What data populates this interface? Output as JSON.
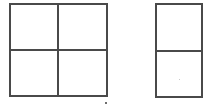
{
  "canvas": {
    "width": 220,
    "height": 110,
    "background_color": "#ffffff"
  },
  "style": {
    "line_color": "#4a4a4a",
    "line_width_px": 2,
    "fill_color": "#ffffff",
    "artifact_color": "#6e6e6e"
  },
  "figures": [
    {
      "id": "figure-quad",
      "name": "two-by-two-grid",
      "description": "Square divided into four equal cells by one vertical and one horizontal line",
      "columns": 2,
      "rows": 2,
      "cell_count": 4,
      "bounds": {
        "x": 9,
        "y": 3,
        "width": 99,
        "height": 94
      },
      "vertical_divider_x": 57,
      "horizontal_divider_y": 49,
      "cells": [
        {
          "id": "cell-top-left",
          "label": ""
        },
        {
          "id": "cell-top-right",
          "label": ""
        },
        {
          "id": "cell-bottom-left",
          "label": ""
        },
        {
          "id": "cell-bottom-right",
          "label": ""
        }
      ]
    },
    {
      "id": "figure-pair",
      "name": "one-by-two-grid",
      "description": "Tall rectangle divided into two stacked equal cells by one horizontal line",
      "columns": 1,
      "rows": 2,
      "cell_count": 2,
      "bounds": {
        "x": 155,
        "y": 3,
        "width": 48,
        "height": 95
      },
      "vertical_divider_x": null,
      "horizontal_divider_y": 50,
      "cells": [
        {
          "id": "cell-top",
          "label": ""
        },
        {
          "id": "cell-bottom",
          "label": ""
        }
      ]
    }
  ],
  "artifacts": [
    {
      "id": "speck-below-quad",
      "name": "scan-speck",
      "x": 105,
      "y": 102,
      "size_px": 2
    },
    {
      "id": "speck-inside-pair",
      "name": "faint-scan-dot",
      "x": 177,
      "y": 77,
      "size_px": 1
    }
  ]
}
